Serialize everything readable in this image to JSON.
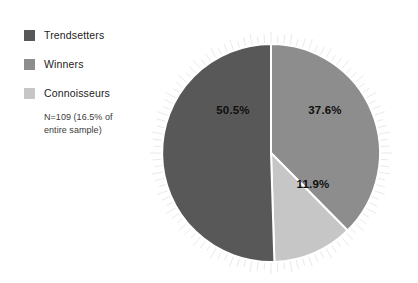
{
  "legend": {
    "items": [
      {
        "label": "Trendsetters",
        "color": "#585858",
        "swatch_name": "legend-swatch-trendsetters"
      },
      {
        "label": "Winners",
        "color": "#8d8d8d",
        "swatch_name": "legend-swatch-winners"
      },
      {
        "label": "Connoisseurs",
        "color": "#c6c6c6",
        "swatch_name": "legend-swatch-connoisseurs"
      }
    ],
    "note_line1": "N=109 (16.5% of",
    "note_line2": "entire sample)"
  },
  "chart_data": {
    "type": "pie",
    "title": "",
    "labels": [
      "Trendsetters",
      "Winners",
      "Connoisseurs"
    ],
    "values": [
      50.5,
      37.6,
      11.9
    ],
    "value_labels": [
      "50.5%",
      "37.6%",
      "11.9%"
    ],
    "colors": [
      "#585858",
      "#8d8d8d",
      "#c6c6c6"
    ],
    "unit": "percent",
    "total": 100.0,
    "sample_size": 109,
    "sample_share_of_total": 16.5,
    "legend_position": "left",
    "grid": false,
    "start_angle_deg": 0,
    "direction": "clockwise",
    "slice_order_clockwise_from_top": [
      "Winners",
      "Connoisseurs",
      "Trendsetters"
    ],
    "slice_label_positions": [
      {
        "label": "50.5%",
        "x": 83,
        "y": 92
      },
      {
        "label": "37.6%",
        "x": 175,
        "y": 92
      },
      {
        "label": "11.9%",
        "x": 163,
        "y": 166
      }
    ],
    "geometry": {
      "cx": 121,
      "cy": 131,
      "r": 109
    }
  }
}
